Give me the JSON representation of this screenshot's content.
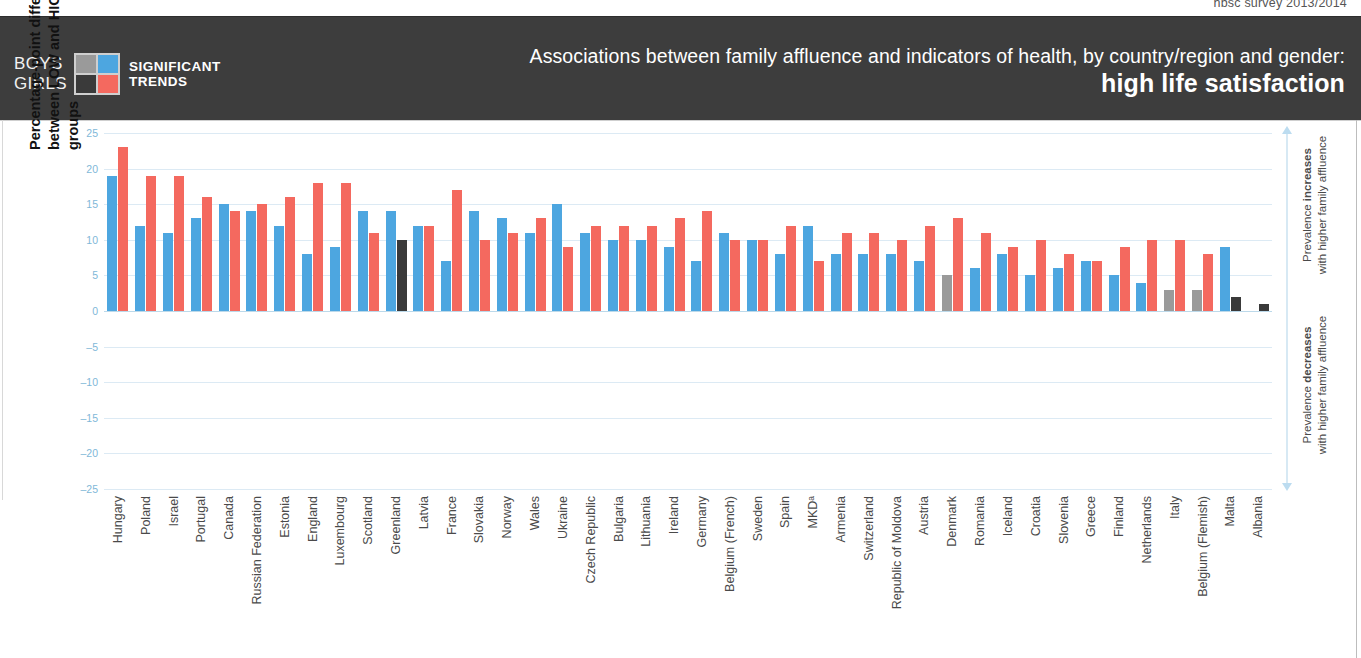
{
  "survey_label": "hbsc survey 2013/2014",
  "header": {
    "legend": {
      "boys_label": "BOYS",
      "girls_label": "GIRLS",
      "trend_line1": "SIGNIFICANT",
      "trend_line2": "TRENDS",
      "swatch_boys_nonsig_color": "#9a9a9a",
      "swatch_boys_sig_color": "#4da6e0",
      "swatch_girls_nonsig_color": "#3a3a3a",
      "swatch_girls_sig_color": "#f4695f"
    },
    "title_line1": "Associations between family affluence and indicators of health, by country/region and gender:",
    "title_line2": "high life satisfaction"
  },
  "axis": {
    "ylabel_line1": "Percentage-point difference in prevalence",
    "ylabel_line2": "between LOW and HIGH family affluence groups",
    "ticks": [
      25,
      20,
      15,
      10,
      5,
      0,
      -5,
      -10,
      -15,
      -20,
      -25
    ]
  },
  "annotations": {
    "up_strong": "increases",
    "up_prefix": "Prevalence ",
    "up_suffix": "with higher family affluence",
    "down_strong": "decreases",
    "down_prefix": "Prevalence ",
    "down_suffix": "with higher family affluence"
  },
  "chart_data": {
    "type": "bar",
    "title": "Associations between family affluence and indicators of health, by country/region and gender: high life satisfaction",
    "xlabel": "",
    "ylabel": "Percentage-point difference in prevalence between LOW and HIGH family affluence groups",
    "ylim": [
      -25,
      25
    ],
    "ytick_step": 5,
    "grid": true,
    "legend_position": "top-left",
    "categories": [
      "Hungary",
      "Poland",
      "Israel",
      "Portugal",
      "Canada",
      "Russian Federation",
      "Estonia",
      "England",
      "Luxembourg",
      "Scotland",
      "Greenland",
      "Latvia",
      "France",
      "Slovakia",
      "Norway",
      "Wales",
      "Ukraine",
      "Czech Republic",
      "Bulgaria",
      "Lithuania",
      "Ireland",
      "Germany",
      "Belgium (French)",
      "Sweden",
      "Spain",
      "MKDᵃ",
      "Armenia",
      "Switzerland",
      "Republic of Moldova",
      "Austria",
      "Denmark",
      "Romania",
      "Iceland",
      "Croatia",
      "Slovenia",
      "Greece",
      "Finland",
      "Netherlands",
      "Italy",
      "Belgium (Flemish)",
      "Malta",
      "Albania"
    ],
    "series": [
      {
        "name": "Boys",
        "color_significant": "#4da6e0",
        "color_nonsignificant": "#9a9a9a",
        "values": [
          19,
          12,
          11,
          13,
          15,
          14,
          12,
          8,
          9,
          14,
          14,
          12,
          7,
          14,
          13,
          11,
          15,
          11,
          10,
          10,
          9,
          7,
          11,
          10,
          8,
          12,
          8,
          8,
          8,
          7,
          5,
          6,
          8,
          5,
          6,
          7,
          5,
          4,
          3,
          3,
          9,
          0
        ],
        "significant": [
          true,
          true,
          true,
          true,
          true,
          true,
          true,
          true,
          true,
          true,
          true,
          true,
          true,
          true,
          true,
          true,
          true,
          true,
          true,
          true,
          true,
          true,
          true,
          true,
          true,
          true,
          true,
          true,
          true,
          true,
          false,
          true,
          true,
          true,
          true,
          true,
          true,
          true,
          false,
          false,
          true,
          false
        ]
      },
      {
        "name": "Girls",
        "color_significant": "#f4695f",
        "color_nonsignificant": "#3a3a3a",
        "values": [
          23,
          19,
          19,
          16,
          14,
          15,
          16,
          18,
          18,
          11,
          10,
          12,
          17,
          10,
          11,
          13,
          9,
          12,
          12,
          12,
          13,
          14,
          10,
          10,
          12,
          7,
          11,
          11,
          10,
          12,
          13,
          11,
          9,
          10,
          8,
          7,
          9,
          10,
          10,
          8,
          2,
          1
        ],
        "significant": [
          true,
          true,
          true,
          true,
          true,
          true,
          true,
          true,
          true,
          true,
          false,
          true,
          true,
          true,
          true,
          true,
          true,
          true,
          true,
          true,
          true,
          true,
          true,
          true,
          true,
          true,
          true,
          true,
          true,
          true,
          true,
          true,
          true,
          true,
          true,
          true,
          true,
          true,
          true,
          true,
          false,
          false
        ]
      }
    ]
  }
}
